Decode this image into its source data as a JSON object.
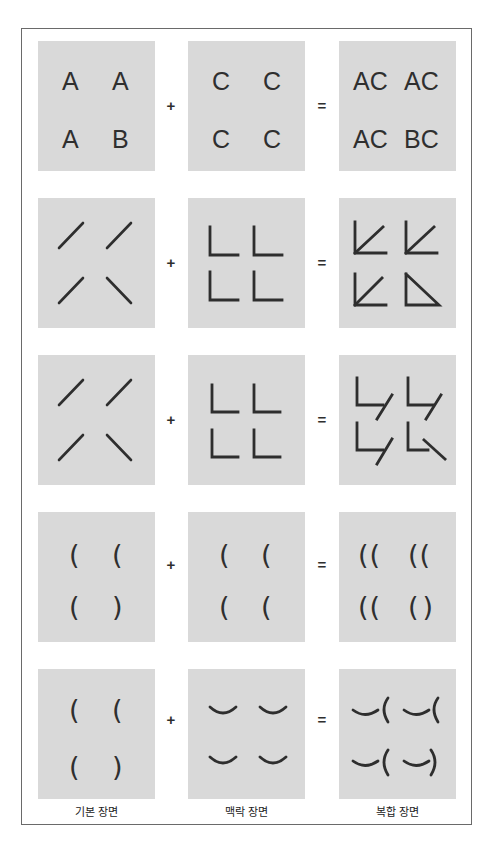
{
  "operators": {
    "plus": "+",
    "equals": "="
  },
  "column_labels": [
    "기본 장면",
    "맥락 장면",
    "복합 장면"
  ],
  "colors": {
    "panel": "#d9d9d9",
    "stroke": "#2e2e2e",
    "frame_border": "#6a6a6a"
  },
  "rows": [
    {
      "type": "letters",
      "base": [
        "A",
        "A",
        "A",
        "B"
      ],
      "context": [
        "C",
        "C",
        "C",
        "C"
      ],
      "composite": [
        "AC",
        "AC",
        "AC",
        "BC"
      ]
    },
    {
      "type": "lines-corner",
      "base": [
        "slash",
        "slash",
        "slash",
        "backslash"
      ],
      "context": [
        "L-corner",
        "L-corner",
        "L-corner",
        "L-corner"
      ],
      "composite": [
        "arrow",
        "arrow",
        "arrow",
        "triangle"
      ]
    },
    {
      "type": "lines-offset",
      "base": [
        "slash",
        "slash",
        "slash",
        "backslash"
      ],
      "context": [
        "L-corner",
        "L-corner",
        "L-corner",
        "L-corner"
      ],
      "composite": [
        "L+slash",
        "L+slash",
        "L+slash",
        "L+backslash"
      ]
    },
    {
      "type": "parens",
      "base": [
        "(",
        "(",
        "(",
        ")"
      ],
      "context": [
        "(",
        "(",
        "(",
        "("
      ],
      "composite": [
        "((",
        "((",
        "((",
        "()"
      ]
    },
    {
      "type": "parens-arc",
      "base": [
        "(",
        "(",
        "(",
        ")"
      ],
      "context": [
        "‿",
        "‿",
        "‿",
        "‿"
      ],
      "composite": [
        "‿(",
        "‿(",
        "‿(",
        "‿)"
      ]
    }
  ]
}
